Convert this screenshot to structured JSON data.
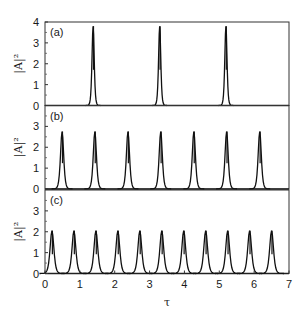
{
  "chart_data": {
    "type": "line",
    "xlabel": "τ",
    "ylabel": "|A|²",
    "xlim": [
      0,
      7
    ],
    "xticks": [
      0,
      1,
      2,
      3,
      4,
      5,
      6,
      7
    ],
    "grid": false,
    "legend": null,
    "panels": [
      {
        "label": "(a)",
        "ylim": [
          0,
          4
        ],
        "yticks": [
          0,
          1,
          2,
          3,
          4
        ],
        "peak_height": 3.8,
        "peak_width": 0.07,
        "peak_positions": [
          1.38,
          3.29,
          5.19
        ]
      },
      {
        "label": "(b)",
        "ylim": [
          0,
          4
        ],
        "yticks": [
          0,
          1,
          2,
          3
        ],
        "peak_height": 2.75,
        "peak_width": 0.1,
        "peak_positions": [
          0.49,
          1.43,
          2.38,
          3.32,
          4.27,
          5.21,
          6.16
        ]
      },
      {
        "label": "(c)",
        "ylim": [
          0,
          4
        ],
        "yticks": [
          0,
          1,
          2,
          3
        ],
        "peak_height": 2.05,
        "peak_width": 0.12,
        "peak_positions": [
          0.2,
          0.83,
          1.46,
          2.09,
          2.72,
          3.35,
          3.98,
          4.61,
          5.24,
          5.87,
          6.5
        ]
      }
    ]
  }
}
